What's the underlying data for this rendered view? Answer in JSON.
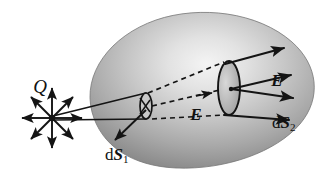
{
  "figure": {
    "kind": "physics-diagram",
    "topic": "Electric flux through a closed surface (Gauss's law)",
    "background_color": "#ffffff",
    "ink_color": "#141414"
  },
  "surface": {
    "name": "closed-gaussian-surface",
    "shape": "irregular-blob-ovoid",
    "shading": "radial-gradient-gray",
    "highlight_color": "#f2f2f2",
    "mid_color": "#b9b9b9",
    "edge_color": "#707070",
    "outline_color": "#6f6f6f"
  },
  "labels": {
    "charge": "Q",
    "field_inner": "E",
    "field_outer": "E",
    "area_small_prefix": "d",
    "area_small_symbol": "S",
    "area_small_sub": "1",
    "area_large_prefix": "d",
    "area_large_symbol": "S",
    "area_large_sub": "2"
  },
  "elements": {
    "point_charge": {
      "label": "Q",
      "position": [
        52,
        118
      ],
      "ray_count": 8,
      "ray_length": 30,
      "description": "point charge with eight radiating field arrows"
    },
    "cone": {
      "description": "narrow solid-angle cone from Q through dS1 out to dS2",
      "apex": [
        52,
        118
      ],
      "dashed_axis": true
    },
    "area_small": {
      "label": "dS1",
      "center": [
        146,
        106
      ],
      "rx": 6,
      "ry": 13,
      "normal_arrow": "down-left"
    },
    "area_large": {
      "label": "dS2",
      "center": [
        229,
        88
      ],
      "rx": 11,
      "ry": 27,
      "field_arrow_count": 4
    }
  },
  "annotations": [
    {
      "name": "charge-label",
      "text": "Q",
      "x": 40,
      "y": 88
    },
    {
      "name": "field-label-inner",
      "text": "E",
      "x": 196,
      "y": 115
    },
    {
      "name": "field-label-outer",
      "text": "E",
      "x": 276,
      "y": 82
    },
    {
      "name": "area-small-label",
      "text": "dS1",
      "x": 118,
      "y": 155
    },
    {
      "name": "area-large-label",
      "text": "dS2",
      "x": 285,
      "y": 124
    }
  ]
}
